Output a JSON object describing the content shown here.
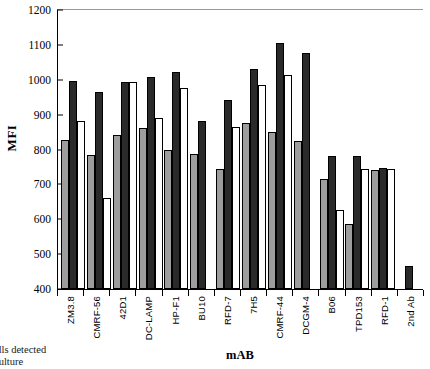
{
  "chart_data": {
    "type": "bar",
    "title": "",
    "xlabel": "mAB",
    "ylabel": "MFI",
    "ylim": [
      400,
      1200
    ],
    "ytick_step": 100,
    "yticks": [
      1200,
      1100,
      1000,
      900,
      800,
      700,
      600,
      500,
      400
    ],
    "grid": false,
    "legend_position": "none",
    "categories": [
      "ZM3.8",
      "CMRF-56",
      "42D1",
      "DC-LAMP",
      "HP-F1",
      "BU10",
      "RFD-7",
      "7H5",
      "CMRF-44",
      "DCGM-4",
      "B06",
      "TPD153",
      "RFD-1",
      "2nd Ab"
    ],
    "series": [
      {
        "name": "series-1",
        "color": "#9d9d9d",
        "values": [
          823,
          782,
          838,
          858,
          795,
          783,
          742,
          874,
          846,
          820,
          713,
          585,
          740,
          null
        ]
      },
      {
        "name": "series-2",
        "color": "#2a2a2a",
        "values": [
          993,
          960,
          990,
          1004,
          1017,
          877,
          938,
          1026,
          1100,
          1072,
          780,
          780,
          745,
          465
        ]
      },
      {
        "name": "series-3",
        "color": "#ffffff",
        "values": [
          877,
          660,
          988,
          888,
          972,
          null,
          862,
          980,
          1008,
          null,
          625,
          742,
          742,
          null
        ]
      }
    ]
  },
  "caption": {
    "line1": "ells detected",
    "line2": "culture"
  }
}
